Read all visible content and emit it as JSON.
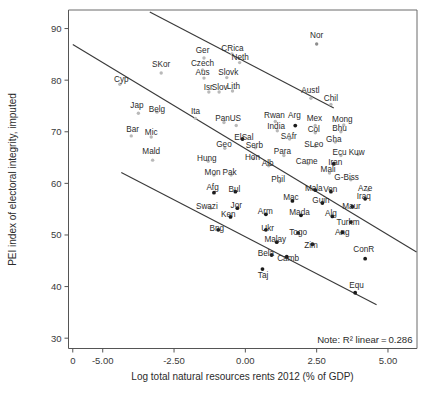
{
  "chart_data": {
    "type": "scatter",
    "title": "",
    "xlabel": "Log total natural resources rents 2012 (% of GDP)",
    "ylabel": "PEI index of electoral integrity, imputed",
    "xlim": [
      -6.2,
      6.0
    ],
    "ylim": [
      28.0,
      93.5
    ],
    "xticks": [
      "0",
      "-5.00",
      "-2.50",
      "0.00",
      "2.50",
      "5.00"
    ],
    "xtick_values": [
      -6.05,
      -5.0,
      -2.5,
      0.0,
      2.5,
      5.0
    ],
    "yticks": [
      "30",
      "40",
      "50",
      "60",
      "70",
      "80",
      "90"
    ],
    "ytick_values": [
      30,
      40,
      50,
      60,
      70,
      80,
      90
    ],
    "grid": false,
    "legend": null,
    "annotation": "Note: R² linear = 0.286",
    "r2": 0.286,
    "fit_lines": [
      {
        "name": "upper-confidence-line",
        "x1": -3.35,
        "y1": 93.2,
        "x2": 3.1,
        "y2": 74.6
      },
      {
        "name": "regression-line",
        "x1": -6.05,
        "y1": 86.9,
        "x2": 6.0,
        "y2": 46.7
      },
      {
        "name": "lower-confidence-line",
        "x1": -4.35,
        "y1": 62.1,
        "x2": 4.6,
        "y2": 36.5
      }
    ],
    "points": [
      {
        "label": "Nor",
        "x": 2.5,
        "y": 87.0,
        "lx": 2.5,
        "ly": 88.8,
        "tone": "mid"
      },
      {
        "label": "Ger",
        "x": -1.45,
        "y": 84.3,
        "lx": -1.5,
        "ly": 85.8,
        "tone": "faint"
      },
      {
        "label": "CRica",
        "x": -0.47,
        "y": 85.1,
        "lx": -0.45,
        "ly": 86.2,
        "tone": "faint"
      },
      {
        "label": "Neth",
        "x": -0.2,
        "y": 83.4,
        "lx": -0.18,
        "ly": 84.5,
        "tone": "faint"
      },
      {
        "label": "SKor",
        "x": -2.95,
        "y": 81.4,
        "lx": -2.95,
        "ly": 83.1,
        "tone": "faint"
      },
      {
        "label": "Czech",
        "x": -1.5,
        "y": 82.0,
        "lx": -1.5,
        "ly": 83.3,
        "tone": "faint"
      },
      {
        "label": "Aus",
        "x": -1.45,
        "y": 80.4,
        "lx": -1.5,
        "ly": 81.5,
        "tone": "faint"
      },
      {
        "label": "Slovk",
        "x": -0.65,
        "y": 80.5,
        "lx": -0.6,
        "ly": 81.5,
        "tone": "faint"
      },
      {
        "label": "Isr",
        "x": -1.28,
        "y": 77.7,
        "lx": -1.3,
        "ly": 78.6,
        "tone": "faint"
      },
      {
        "label": "Slov",
        "x": -0.92,
        "y": 77.7,
        "lx": -0.9,
        "ly": 78.6,
        "tone": "faint"
      },
      {
        "label": "Lith",
        "x": -0.45,
        "y": 77.9,
        "lx": -0.42,
        "ly": 78.8,
        "tone": "faint"
      },
      {
        "label": "Austl",
        "x": 2.3,
        "y": 76.5,
        "lx": 2.28,
        "ly": 78.0,
        "tone": "faint"
      },
      {
        "label": "Chil",
        "x": 3.0,
        "y": 75.3,
        "lx": 3.0,
        "ly": 76.6,
        "tone": "faint"
      },
      {
        "label": "Cyp",
        "x": -4.4,
        "y": 79.2,
        "lx": -4.35,
        "ly": 80.3,
        "tone": "faint"
      },
      {
        "label": "Jap",
        "x": -3.75,
        "y": 73.6,
        "lx": -3.8,
        "ly": 75.1,
        "tone": "faint"
      },
      {
        "label": "Belg",
        "x": -3.1,
        "y": 73.8,
        "lx": -3.1,
        "ly": 74.5,
        "tone": "faint"
      },
      {
        "label": "Ita",
        "x": -1.75,
        "y": 72.6,
        "lx": -1.75,
        "ly": 74.1,
        "tone": "faint"
      },
      {
        "label": "Pan",
        "x": -0.75,
        "y": 71.8,
        "lx": -0.8,
        "ly": 72.7,
        "tone": "faint"
      },
      {
        "label": "US",
        "x": -0.32,
        "y": 71.2,
        "lx": -0.35,
        "ly": 72.6,
        "tone": "faint"
      },
      {
        "label": "Rwan",
        "x": 1.05,
        "y": 72.0,
        "lx": 1.02,
        "ly": 73.2,
        "tone": "faint"
      },
      {
        "label": "Arg",
        "x": 1.75,
        "y": 71.2,
        "lx": 1.72,
        "ly": 73.2,
        "tone": "dark"
      },
      {
        "label": "Mex",
        "x": 2.45,
        "y": 71.2,
        "lx": 2.42,
        "ly": 72.6,
        "tone": "faint"
      },
      {
        "label": "Mong",
        "x": 3.45,
        "y": 71.3,
        "lx": 3.4,
        "ly": 72.5,
        "tone": "faint"
      },
      {
        "label": "India",
        "x": 1.12,
        "y": 70.2,
        "lx": 1.08,
        "ly": 71.2,
        "tone": "faint"
      },
      {
        "label": "Col",
        "x": 2.45,
        "y": 69.8,
        "lx": 2.4,
        "ly": 70.6,
        "tone": "faint"
      },
      {
        "label": "Bhu",
        "x": 3.35,
        "y": 70.0,
        "lx": 3.3,
        "ly": 70.7,
        "tone": "faint"
      },
      {
        "label": "Bar",
        "x": -4.0,
        "y": 69.2,
        "lx": -3.95,
        "ly": 70.6,
        "tone": "faint"
      },
      {
        "label": "Mic",
        "x": -3.3,
        "y": 69.0,
        "lx": -3.3,
        "ly": 70.0,
        "tone": "faint"
      },
      {
        "label": "ElSal",
        "x": -0.1,
        "y": 68.6,
        "lx": -0.05,
        "ly": 68.9,
        "tone": "dark"
      },
      {
        "label": "SAfr",
        "x": 1.55,
        "y": 68.6,
        "lx": 1.52,
        "ly": 69.2,
        "tone": "faint"
      },
      {
        "label": "Gha",
        "x": 3.15,
        "y": 68.0,
        "lx": 3.1,
        "ly": 68.6,
        "tone": "faint"
      },
      {
        "label": "Geo",
        "x": -0.72,
        "y": 66.8,
        "lx": -0.75,
        "ly": 67.6,
        "tone": "faint"
      },
      {
        "label": "Serb",
        "x": 0.35,
        "y": 66.9,
        "lx": 0.32,
        "ly": 67.5,
        "tone": "faint"
      },
      {
        "label": "SLeo",
        "x": 2.45,
        "y": 67.2,
        "lx": 2.4,
        "ly": 67.6,
        "tone": "faint"
      },
      {
        "label": "Mald",
        "x": -3.25,
        "y": 64.5,
        "lx": -3.3,
        "ly": 66.2,
        "tone": "faint"
      },
      {
        "label": "Para",
        "x": 1.35,
        "y": 65.4,
        "lx": 1.3,
        "ly": 66.2,
        "tone": "faint"
      },
      {
        "label": "Ecu",
        "x": 3.35,
        "y": 65.4,
        "lx": 3.3,
        "ly": 66.1,
        "tone": "faint"
      },
      {
        "label": "Kuw",
        "x": 3.95,
        "y": 65.6,
        "lx": 3.9,
        "ly": 66.1,
        "tone": "faint"
      },
      {
        "label": "Hon",
        "x": 0.28,
        "y": 64.8,
        "lx": 0.25,
        "ly": 65.1,
        "tone": "faint"
      },
      {
        "label": "Hung",
        "x": -1.3,
        "y": 64.3,
        "lx": -1.35,
        "ly": 64.9,
        "tone": "faint"
      },
      {
        "label": "Came",
        "x": 2.2,
        "y": 63.8,
        "lx": 2.15,
        "ly": 64.4,
        "tone": "faint"
      },
      {
        "label": "Iran",
        "x": 3.1,
        "y": 63.8,
        "lx": 3.15,
        "ly": 64.2,
        "tone": "dark"
      },
      {
        "label": "Alb",
        "x": 0.82,
        "y": 63.4,
        "lx": 0.78,
        "ly": 64.0,
        "tone": "faint"
      },
      {
        "label": "Mali",
        "x": 2.95,
        "y": 62.0,
        "lx": 2.9,
        "ly": 62.8,
        "tone": "faint"
      },
      {
        "label": "Mon",
        "x": -1.1,
        "y": 61.6,
        "lx": -1.15,
        "ly": 62.2,
        "tone": "faint"
      },
      {
        "label": "Pak",
        "x": -0.5,
        "y": 61.6,
        "lx": -0.55,
        "ly": 62.2,
        "tone": "faint"
      },
      {
        "label": "G-Biss",
        "x": 3.7,
        "y": 60.7,
        "lx": 3.55,
        "ly": 61.3,
        "tone": "faint"
      },
      {
        "label": "Phil",
        "x": 1.2,
        "y": 60.3,
        "lx": 1.15,
        "ly": 60.8,
        "tone": "faint"
      },
      {
        "label": "Afg",
        "x": -1.1,
        "y": 58.2,
        "lx": -1.15,
        "ly": 59.3,
        "tone": "dark"
      },
      {
        "label": "Bul",
        "x": -0.35,
        "y": 58.4,
        "lx": -0.38,
        "ly": 59.0,
        "tone": "dark"
      },
      {
        "label": "Mala",
        "x": 2.45,
        "y": 58.7,
        "lx": 2.4,
        "ly": 59.1,
        "tone": "dark"
      },
      {
        "label": "Ven",
        "x": 3.0,
        "y": 58.4,
        "lx": 2.98,
        "ly": 59.0,
        "tone": "dark"
      },
      {
        "label": "Aze",
        "x": 4.3,
        "y": 58.7,
        "lx": 4.2,
        "ly": 59.1,
        "tone": "faint"
      },
      {
        "label": "Iraq",
        "x": 4.2,
        "y": 57.0,
        "lx": 4.15,
        "ly": 57.6,
        "tone": "dark"
      },
      {
        "label": "Mac",
        "x": 1.65,
        "y": 56.6,
        "lx": 1.6,
        "ly": 57.3,
        "tone": "dark"
      },
      {
        "label": "Guin",
        "x": 2.7,
        "y": 56.2,
        "lx": 2.65,
        "ly": 56.7,
        "tone": "dark"
      },
      {
        "label": "Swazi",
        "x": -1.22,
        "y": 55.2,
        "lx": -1.35,
        "ly": 55.6,
        "tone": "faint"
      },
      {
        "label": "Jor",
        "x": -0.28,
        "y": 55.2,
        "lx": -0.32,
        "ly": 55.8,
        "tone": "dark"
      },
      {
        "label": "Maur",
        "x": 3.75,
        "y": 55.5,
        "lx": 3.72,
        "ly": 55.6,
        "tone": "dark"
      },
      {
        "label": "Arm",
        "x": 0.72,
        "y": 54.0,
        "lx": 0.7,
        "ly": 54.6,
        "tone": "dark"
      },
      {
        "label": "Mada",
        "x": 1.95,
        "y": 53.8,
        "lx": 1.9,
        "ly": 54.4,
        "tone": "dark"
      },
      {
        "label": "Alg",
        "x": 3.05,
        "y": 53.6,
        "lx": 3.0,
        "ly": 54.2,
        "tone": "dark"
      },
      {
        "label": "Ken",
        "x": -0.52,
        "y": 53.5,
        "lx": -0.6,
        "ly": 54.0,
        "tone": "dark"
      },
      {
        "label": "Turkm",
        "x": 3.7,
        "y": 52.5,
        "lx": 3.6,
        "ly": 52.6,
        "tone": "dark"
      },
      {
        "label": "Bng",
        "x": -0.95,
        "y": 51.0,
        "lx": -1.0,
        "ly": 51.4,
        "tone": "dark"
      },
      {
        "label": "Ukr",
        "x": 0.72,
        "y": 51.0,
        "lx": 0.78,
        "ly": 51.3,
        "tone": "dark"
      },
      {
        "label": "Togo",
        "x": 1.85,
        "y": 50.4,
        "lx": 1.85,
        "ly": 50.5,
        "tone": "dark"
      },
      {
        "label": "Ang",
        "x": 3.4,
        "y": 50.5,
        "lx": 3.4,
        "ly": 50.5,
        "tone": "dark"
      },
      {
        "label": "Malay",
        "x": 1.1,
        "y": 48.6,
        "lx": 1.05,
        "ly": 49.3,
        "tone": "dark"
      },
      {
        "label": "Zim",
        "x": 2.35,
        "y": 48.2,
        "lx": 2.3,
        "ly": 48.0,
        "tone": "dark"
      },
      {
        "label": "ConR",
        "x": 4.2,
        "y": 45.4,
        "lx": 4.15,
        "ly": 47.3,
        "tone": "dark"
      },
      {
        "label": "Bela",
        "x": 0.92,
        "y": 46.1,
        "lx": 0.72,
        "ly": 46.6,
        "tone": "dark"
      },
      {
        "label": "Camb",
        "x": 1.45,
        "y": 45.8,
        "lx": 1.5,
        "ly": 45.5,
        "tone": "dark"
      },
      {
        "label": "Taj",
        "x": 0.6,
        "y": 43.4,
        "lx": 0.62,
        "ly": 42.3,
        "tone": "dark"
      },
      {
        "label": "Equ",
        "x": 3.85,
        "y": 38.8,
        "lx": 3.9,
        "ly": 40.3,
        "tone": "dark"
      }
    ]
  }
}
